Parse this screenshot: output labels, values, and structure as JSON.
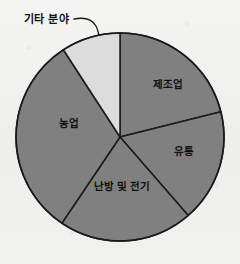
{
  "chart_data": {
    "type": "pie",
    "title": "",
    "subtitle": "",
    "xlabel": "",
    "ylabel": "",
    "legend_position": "none",
    "grid": false,
    "start_angle_deg": 0,
    "direction": "clockwise",
    "center": {
      "x": 120,
      "y": 137
    },
    "radius": 104,
    "categories": [
      "제조업",
      "유통",
      "난방 및 전기",
      "농업",
      "기타 분야"
    ],
    "values": [
      21.1,
      17.5,
      20.8,
      31.4,
      9.2
    ],
    "slices": [
      {
        "label": "제조업",
        "value": 21.1,
        "start_angle_deg": 0,
        "end_angle_deg": 76,
        "color": "#808080",
        "label_placement": "inside",
        "label_x": 168,
        "label_y": 85
      },
      {
        "label": "유통",
        "value": 17.5,
        "start_angle_deg": 76,
        "end_angle_deg": 139,
        "color": "#808080",
        "label_placement": "inside",
        "label_x": 184,
        "label_y": 152
      },
      {
        "label": "난방 및 전기",
        "value": 20.8,
        "start_angle_deg": 139,
        "end_angle_deg": 214,
        "color": "#808080",
        "label_placement": "inside",
        "label_x": 122,
        "label_y": 187
      },
      {
        "label": "농업",
        "value": 31.4,
        "start_angle_deg": 214,
        "end_angle_deg": 327,
        "color": "#808080",
        "label_placement": "inside",
        "label_x": 69,
        "label_y": 124
      },
      {
        "label": "기타 분야",
        "value": 9.2,
        "start_angle_deg": 327,
        "end_angle_deg": 360,
        "color": "#dcdcdc",
        "label_placement": "callout",
        "label_x": 24,
        "label_y": 20
      }
    ],
    "colors": {
      "slice_gray": "#808080",
      "slice_light": "#dcdcdc",
      "outline": "#1a1a1a",
      "label_text": "#111111",
      "background": "#f2f2f0"
    }
  }
}
